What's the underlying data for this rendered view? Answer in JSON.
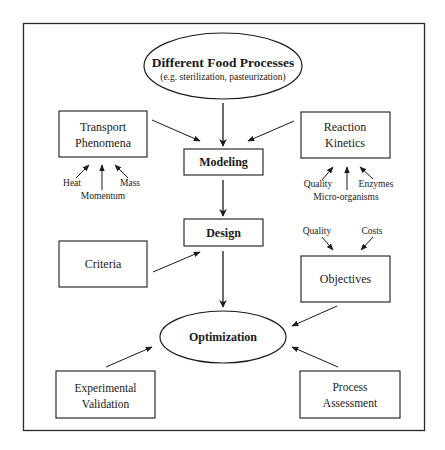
{
  "diagram": {
    "top_node": {
      "title": "Different Food Processes",
      "subtitle": "(e.g. sterilization, pasteurization)"
    },
    "transport": {
      "line1": "Transport",
      "line2": "Phenomena",
      "inputs": [
        "Heat",
        "Momentum",
        "Mass"
      ]
    },
    "reaction": {
      "line1": "Reaction",
      "line2": "Kinetics",
      "inputs": [
        "Quality",
        "Micro-organisms",
        "Enzymes"
      ]
    },
    "modeling": {
      "label": "Modeling"
    },
    "design": {
      "label": "Design"
    },
    "criteria": {
      "label": "Criteria"
    },
    "objectives": {
      "label": "Objectives",
      "inputs": [
        "Quality",
        "Costs"
      ]
    },
    "optimization": {
      "label": "Optimization"
    },
    "experimental": {
      "line1": "Experimental",
      "line2": "Validation"
    },
    "process": {
      "line1": "Process",
      "line2": "Assessment"
    },
    "edges": [
      {
        "from": "Different Food Processes",
        "to": "Modeling"
      },
      {
        "from": "Transport Phenomena",
        "to": "Modeling"
      },
      {
        "from": "Reaction Kinetics",
        "to": "Modeling"
      },
      {
        "from": "Heat",
        "to": "Transport Phenomena"
      },
      {
        "from": "Momentum",
        "to": "Transport Phenomena"
      },
      {
        "from": "Mass",
        "to": "Transport Phenomena"
      },
      {
        "from": "Quality",
        "to": "Reaction Kinetics"
      },
      {
        "from": "Micro-organisms",
        "to": "Reaction Kinetics"
      },
      {
        "from": "Enzymes",
        "to": "Reaction Kinetics"
      },
      {
        "from": "Modeling",
        "to": "Design"
      },
      {
        "from": "Criteria",
        "to": "Design"
      },
      {
        "from": "Design",
        "to": "Optimization"
      },
      {
        "from": "Quality",
        "to": "Objectives"
      },
      {
        "from": "Costs",
        "to": "Objectives"
      },
      {
        "from": "Objectives",
        "to": "Optimization"
      },
      {
        "from": "Experimental Validation",
        "to": "Optimization"
      },
      {
        "from": "Process Assessment",
        "to": "Optimization"
      }
    ]
  }
}
